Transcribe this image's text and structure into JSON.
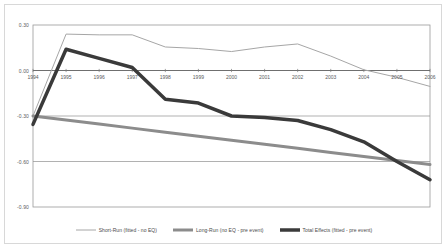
{
  "chart_data": {
    "type": "line",
    "title": "",
    "xlabel": "",
    "ylabel": "",
    "categories": [
      "1994",
      "1995",
      "1996",
      "1997",
      "1998",
      "1999",
      "2000",
      "2001",
      "2002",
      "2003",
      "2004",
      "2005",
      "2006"
    ],
    "x": [
      1994,
      1995,
      1996,
      1997,
      1998,
      1999,
      2000,
      2001,
      2002,
      2003,
      2004,
      2005,
      2006
    ],
    "ylim": [
      -0.9,
      0.3
    ],
    "xlim": [
      1994,
      2006
    ],
    "yticks": [
      0.3,
      0.0,
      -0.3,
      -0.6,
      -0.9
    ],
    "ytick_labels": [
      "0.30",
      "0.00",
      "-0.30",
      "-0.60",
      "-0.90"
    ],
    "grid": true,
    "legend_position": "bottom",
    "series": [
      {
        "name": "Short-Run (fitted - no EQ)",
        "color": "#a6a6a6",
        "width": 1,
        "values": [
          -0.3,
          0.24,
          0.235,
          0.235,
          0.155,
          0.145,
          0.125,
          0.155,
          0.175,
          0.095,
          0.005,
          -0.045,
          -0.105
        ]
      },
      {
        "name": "Long-Run (no EQ - pre event)",
        "color": "#8c8c8c",
        "width": 3,
        "values": [
          -0.3,
          -0.327,
          -0.353,
          -0.38,
          -0.407,
          -0.433,
          -0.46,
          -0.487,
          -0.513,
          -0.54,
          -0.567,
          -0.593,
          -0.62
        ]
      },
      {
        "name": "Total Effects (fitted - pre event)",
        "color": "#3a3a3a",
        "width": 3.5,
        "values": [
          -0.355,
          0.14,
          0.08,
          0.02,
          -0.19,
          -0.215,
          -0.3,
          -0.31,
          -0.33,
          -0.39,
          -0.47,
          -0.6,
          -0.72
        ]
      }
    ]
  },
  "yticks": [
    {
      "label": "0.30"
    },
    {
      "label": "0.00"
    },
    {
      "label": "-0.30"
    },
    {
      "label": "-0.60"
    },
    {
      "label": "-0.90"
    }
  ],
  "xticks": [
    {
      "label": "1994"
    },
    {
      "label": "1995"
    },
    {
      "label": "1996"
    },
    {
      "label": "1997"
    },
    {
      "label": "1998"
    },
    {
      "label": "1999"
    },
    {
      "label": "2000"
    },
    {
      "label": "2001"
    },
    {
      "label": "2002"
    },
    {
      "label": "2003"
    },
    {
      "label": "2004"
    },
    {
      "label": "2005"
    },
    {
      "label": "2006"
    }
  ],
  "legend": {
    "items": [
      {
        "label": "Short-Run (fitted - no EQ)"
      },
      {
        "label": "Long-Run (no EQ - pre event)"
      },
      {
        "label": "Total Effects (fitted - pre event)"
      }
    ]
  }
}
